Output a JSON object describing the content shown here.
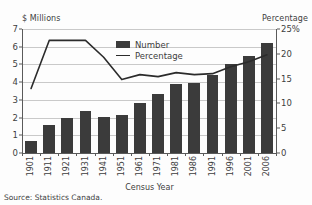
{
  "chart_data": {
    "type": "bar",
    "title": "",
    "subtitle": "",
    "xlabel": "Census Year",
    "ylabel": "$ Millions",
    "ylabel_right": "Percentage",
    "categories": [
      "1901",
      "1911",
      "1921",
      "1931",
      "1941",
      "1951",
      "1961",
      "1971",
      "1981",
      "1986",
      "1991",
      "1996",
      "2001",
      "2006"
    ],
    "series": [
      {
        "name": "Number",
        "type": "bar",
        "axis": "left",
        "unit": "$ Millions",
        "color": "#3b3b3b",
        "values": [
          0.7,
          1.6,
          2.0,
          2.35,
          2.05,
          2.15,
          2.85,
          3.35,
          3.9,
          3.95,
          4.4,
          5.0,
          5.5,
          6.2
        ]
      },
      {
        "name": "Percentage",
        "type": "line",
        "axis": "right",
        "unit": "%",
        "color": "#2b2b2b",
        "values": [
          13.0,
          22.7,
          22.7,
          22.7,
          19.3,
          14.8,
          15.8,
          15.4,
          16.2,
          15.8,
          16.0,
          17.4,
          18.4,
          19.8
        ]
      }
    ],
    "ylim": [
      0,
      7
    ],
    "yticks": [
      "0",
      "1",
      "2",
      "3",
      "4",
      "5",
      "6",
      "7"
    ],
    "ylim_right": [
      0,
      25
    ],
    "yticks_right": [
      "0",
      "5",
      "10",
      "15",
      "20",
      "25%"
    ],
    "grid": true,
    "grid_axis": "y",
    "legend_position": "upper center",
    "legend": [
      "Number",
      "Percentage"
    ]
  },
  "labels": {
    "left_axis_caption": "$ Millions",
    "right_axis_caption": "Percentage",
    "x_axis_title": "Census Year",
    "source_note": "Source: Statistics Canada."
  },
  "legend": {
    "items": [
      {
        "label": "Number",
        "marker": "filled-square"
      },
      {
        "label": "Percentage",
        "marker": "line"
      }
    ]
  },
  "colors": {
    "bar": "#3b3b3b",
    "line": "#2b2b2b",
    "grid": "#c9c9c9",
    "axis": "#5a5a5a",
    "text": "#3d3d3d",
    "background": "#fdfdfd"
  }
}
